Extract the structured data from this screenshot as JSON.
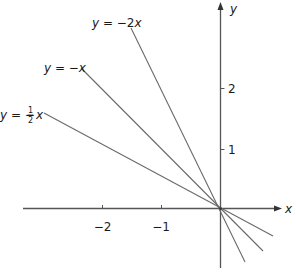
{
  "diagram": {
    "type": "coordinate-graph",
    "axes": {
      "x_label": "x",
      "y_label": "y",
      "x_ticks": [
        {
          "value": -2,
          "label": "−2"
        },
        {
          "value": -1,
          "label": "−1"
        }
      ],
      "y_ticks": [
        {
          "value": 1,
          "label": "1"
        },
        {
          "value": 2,
          "label": "2"
        }
      ]
    },
    "lines": [
      {
        "equation": "y = −2x",
        "label_lhs": "y",
        "label_eq": " = −2",
        "label_var": "x",
        "slope": -2
      },
      {
        "equation": "y = −x",
        "label_lhs": "y",
        "label_eq": " = −",
        "label_var": "x",
        "slope": -1
      },
      {
        "equation": "y = −½x",
        "label_lhs": "y",
        "label_eq": " = −",
        "label_frac_num": "1",
        "label_frac_den": "2",
        "label_var": "x",
        "slope": -0.5
      }
    ]
  }
}
